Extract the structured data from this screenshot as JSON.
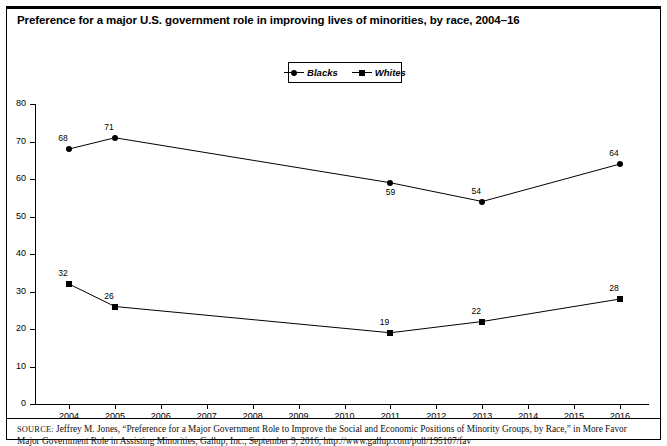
{
  "figure": {
    "title": "Preference for a major U.S. government role in improving lives of minorities, by race, 2004–16",
    "source_prefix": "SOURCE:",
    "source_text": "Jeffrey M. Jones, “Preference for a Major Government Role to Improve the Social and Economic Positions of Minority Groups, by Race,” in More Favor Major Government Role in Assisting Minorities, Gallup, Inc., September 9, 2016, http://www.gallup.com/poll/195107/fav"
  },
  "legend": {
    "position": "top-center",
    "entries": [
      {
        "label": "Blacks",
        "marker": "circle",
        "color": "#000000"
      },
      {
        "label": "Whites",
        "marker": "square",
        "color": "#000000"
      }
    ]
  },
  "chart_data": {
    "type": "line",
    "title": "Preference for a major U.S. government role in improving lives of minorities, by race, 2004–16",
    "xlabel": "",
    "ylabel": "",
    "x": [
      2004,
      2005,
      2006,
      2007,
      2008,
      2009,
      2010,
      2011,
      2012,
      2013,
      2014,
      2015,
      2016
    ],
    "xtick_labels": [
      "2004",
      "2005",
      "2006",
      "2007",
      "2008",
      "2009",
      "2010",
      "2011",
      "2012",
      "2013",
      "2014",
      "2015",
      "2016"
    ],
    "ytick_labels": [
      "0",
      "10",
      "20",
      "30",
      "40",
      "50",
      "60",
      "70",
      "80"
    ],
    "yticks": [
      0,
      10,
      20,
      30,
      40,
      50,
      60,
      70,
      80
    ],
    "ylim": [
      0,
      80
    ],
    "xlim": [
      2004,
      2016
    ],
    "grid": false,
    "series": [
      {
        "name": "Blacks",
        "marker": "circle",
        "color": "#000000",
        "points": [
          {
            "x": 2004,
            "y": 68,
            "label": "68",
            "label_pos": "above-left"
          },
          {
            "x": 2005,
            "y": 71,
            "label": "71",
            "label_pos": "above-left"
          },
          {
            "x": 2011,
            "y": 59,
            "label": "59",
            "label_pos": "below"
          },
          {
            "x": 2013,
            "y": 54,
            "label": "54",
            "label_pos": "above-left"
          },
          {
            "x": 2016,
            "y": 64,
            "label": "64",
            "label_pos": "above-left"
          }
        ]
      },
      {
        "name": "Whites",
        "marker": "square",
        "color": "#000000",
        "points": [
          {
            "x": 2004,
            "y": 32,
            "label": "32",
            "label_pos": "above-left"
          },
          {
            "x": 2005,
            "y": 26,
            "label": "26",
            "label_pos": "above-left"
          },
          {
            "x": 2011,
            "y": 19,
            "label": "19",
            "label_pos": "above-left"
          },
          {
            "x": 2013,
            "y": 22,
            "label": "22",
            "label_pos": "above-left"
          },
          {
            "x": 2016,
            "y": 28,
            "label": "28",
            "label_pos": "above-left"
          }
        ]
      }
    ]
  }
}
